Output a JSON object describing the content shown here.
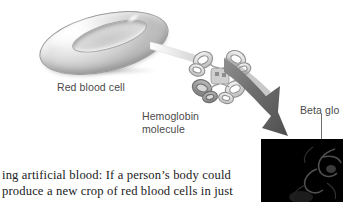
{
  "figure": {
    "background_color": "#ffffff",
    "labels": {
      "red_blood_cell": "Red blood cell",
      "hemoglobin_line1": "Hemoglobin",
      "hemoglobin_line2": "molecule",
      "beta_globin": "Beta glo"
    },
    "label_color": "#4a4a4a",
    "parts": {
      "red_blood_cell_icon": "red-blood-cell",
      "hemoglobin_icon": "hemoglobin-molecule",
      "arrow_icon": "tapered-arrow",
      "inset_panel": "beta-globin-closeup"
    },
    "inset_panel_color": "#000000",
    "arrow_color": "#6b6b6b"
  },
  "body_text": {
    "line1": "ing artificial blood: If a person’s body could",
    "line2": "produce a new crop of red blood cells in just"
  }
}
